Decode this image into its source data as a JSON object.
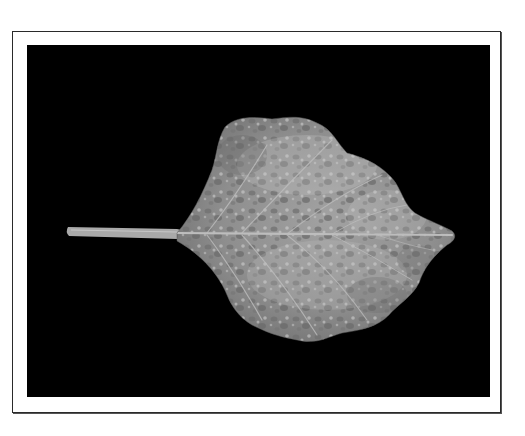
{
  "figure": {
    "colors": {
      "page_background": "#ffffff",
      "frame_border": "#2a2a2a",
      "photo_background": "#000000",
      "leaf_base": "#8c8c8c",
      "leaf_light_patches": "#c4c4c4",
      "leaf_dark_spots": "#6e6e6e",
      "veins": "#b8b8b8"
    }
  }
}
